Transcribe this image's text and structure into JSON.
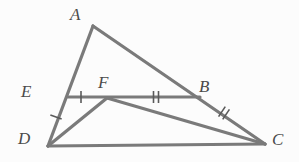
{
  "figure": {
    "kind": "geometry-diagram",
    "background_color": "#fcfcfc",
    "stroke_color": "#7a7a7a",
    "tick_color": "#5a5a5a",
    "label_color": "#4a4a4a",
    "stroke_width": 3.2,
    "tick_width": 1.6,
    "width": 299,
    "height": 162,
    "points": {
      "A": {
        "label": "A",
        "x": 93,
        "y": 26
      },
      "B": {
        "label": "B",
        "x": 200,
        "y": 97
      },
      "C": {
        "label": "C",
        "x": 265,
        "y": 144
      },
      "D": {
        "label": "D",
        "x": 48,
        "y": 146
      },
      "E": {
        "label": "E",
        "x": 68,
        "y": 97
      },
      "F": {
        "label": "F",
        "x": 107,
        "y": 98
      }
    },
    "segments": [
      {
        "name": "AD",
        "from": "A",
        "to": "D",
        "x1": 93,
        "y1": 26,
        "x2": 48,
        "y2": 146
      },
      {
        "name": "AC",
        "from": "A",
        "to": "C",
        "x1": 93,
        "y1": 26,
        "x2": 265,
        "y2": 144
      },
      {
        "name": "DC",
        "from": "D",
        "to": "C",
        "x1": 48,
        "y1": 146,
        "x2": 265,
        "y2": 144
      },
      {
        "name": "EB",
        "from": "E",
        "to": "B",
        "x1": 68,
        "y1": 97,
        "x2": 200,
        "y2": 97
      },
      {
        "name": "DF",
        "from": "D",
        "to": "F",
        "x1": 48,
        "y1": 146,
        "x2": 107,
        "y2": 98
      },
      {
        "name": "FC",
        "from": "F",
        "to": "C",
        "x1": 107,
        "y1": 98,
        "x2": 265,
        "y2": 144
      }
    ],
    "tick_marks": [
      {
        "name": "tick-DE",
        "on_segment": "DE",
        "count": 1,
        "cx": 56,
        "cy": 117,
        "angle": 110
      },
      {
        "name": "tick-EF",
        "on_segment": "EF",
        "count": 1,
        "cx": 81,
        "cy": 97,
        "angle": 0
      },
      {
        "name": "tick-FB",
        "on_segment": "FB",
        "count": 2,
        "cx": 156,
        "cy": 97,
        "angle": 0
      },
      {
        "name": "tick-BC",
        "on_segment": "BC",
        "count": 2,
        "cx": 224,
        "cy": 113,
        "angle": 34
      }
    ],
    "labels": {
      "A": "A",
      "B": "B",
      "C": "C",
      "D": "D",
      "E": "E",
      "F": "F"
    }
  }
}
